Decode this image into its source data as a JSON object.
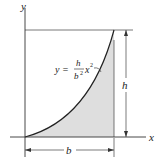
{
  "figure": {
    "axis_x_label": "x",
    "axis_y_label": "y",
    "equation": {
      "lhs": "y = ",
      "numerator": "h",
      "denominator": "b",
      "denominator_exp": "2",
      "var": "x",
      "var_exp": "2"
    },
    "dim_height_label": "h",
    "dim_width_label": "b",
    "colors": {
      "shade": "#dedede",
      "line": "#222222"
    }
  }
}
